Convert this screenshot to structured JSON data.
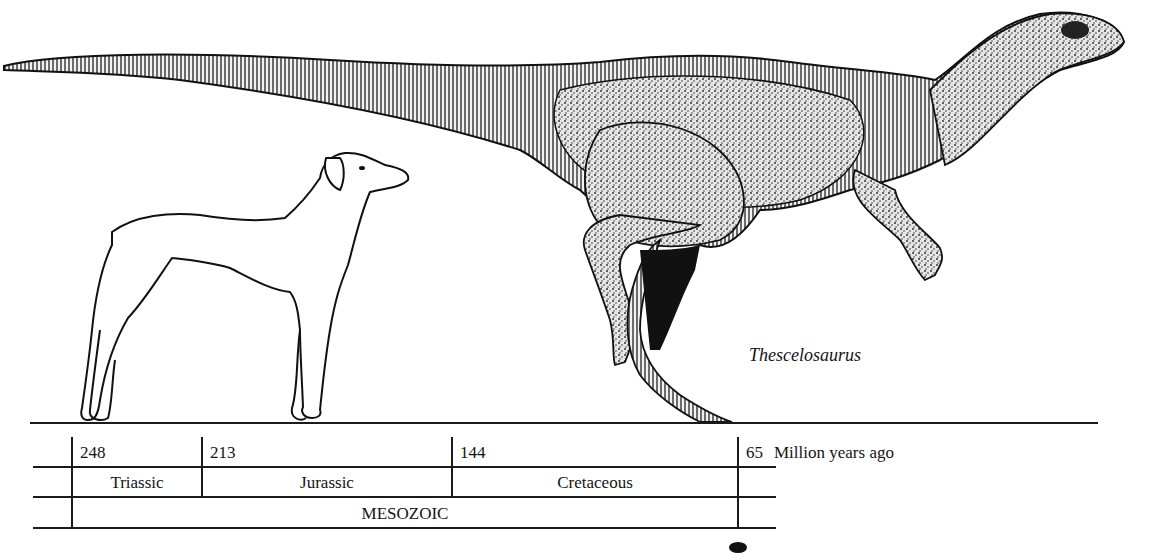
{
  "figure": {
    "species_label": "Thescelosaurus",
    "comparison_animal": "dog",
    "illustration": "Thescelosaurus silhouette with dog for scale"
  },
  "timeline": {
    "unit_label": "Million years ago",
    "ticks": [
      {
        "value": "248"
      },
      {
        "value": "213"
      },
      {
        "value": "144"
      },
      {
        "value": "65"
      }
    ],
    "periods": [
      {
        "name": "Triassic"
      },
      {
        "name": "Jurassic"
      },
      {
        "name": "Cretaceous"
      }
    ],
    "era": "MESOZOIC",
    "marker": "existence-marker"
  },
  "colors": {
    "ink": "#1a1a1a",
    "background": "#ffffff"
  }
}
